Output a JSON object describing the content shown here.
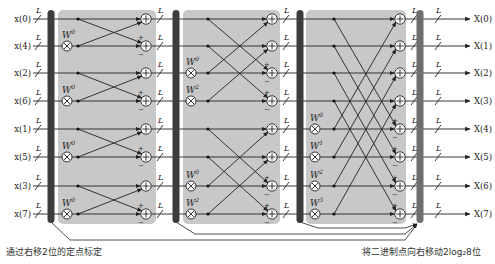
{
  "inputs": [
    "x(0)",
    "x(4)",
    "x(2)",
    "x(6)",
    "x(1)",
    "x(5)",
    "x(3)",
    "x(7)"
  ],
  "outputs": [
    "X(0)",
    "X(1)",
    "X(2)",
    "X(3)",
    "X(4)",
    "X(5)",
    "X(6)",
    "X(7)"
  ],
  "bus_width_label": "L",
  "stages": [
    {
      "name": "stage-1",
      "multipliers": [
        {
          "row": 1,
          "label": "W",
          "exp": "0"
        },
        {
          "row": 3,
          "label": "W",
          "exp": "0"
        },
        {
          "row": 5,
          "label": "W",
          "exp": "0"
        },
        {
          "row": 7,
          "label": "W",
          "exp": "0"
        }
      ],
      "span": 1
    },
    {
      "name": "stage-2",
      "multipliers": [
        {
          "row": 2,
          "label": "W",
          "exp": "0"
        },
        {
          "row": 3,
          "label": "W",
          "exp": "2"
        },
        {
          "row": 6,
          "label": "W",
          "exp": "0"
        },
        {
          "row": 7,
          "label": "W",
          "exp": "2"
        }
      ],
      "span": 2
    },
    {
      "name": "stage-3",
      "multipliers": [
        {
          "row": 4,
          "label": "W",
          "exp": "0"
        },
        {
          "row": 5,
          "label": "W",
          "exp": "1"
        },
        {
          "row": 6,
          "label": "W",
          "exp": "2"
        },
        {
          "row": 7,
          "label": "W",
          "exp": "3"
        }
      ],
      "span": 4
    }
  ],
  "sign_plus": "+",
  "sign_minus": "−",
  "captions": {
    "left": "通过右移2位的定点标定",
    "right": "将二进制点向右移动2log₂8位"
  },
  "colors": {
    "stage_fill": "#c8c8c8",
    "bar_dark": "#3c3c3c",
    "bar_light": "#6e6e6e",
    "line": "#222222"
  }
}
